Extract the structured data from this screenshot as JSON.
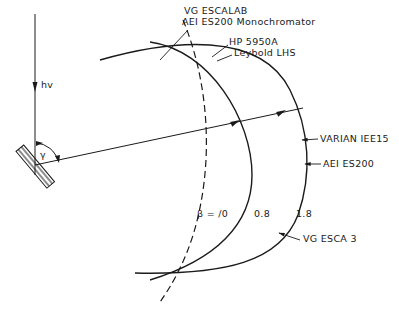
{
  "diagram": {
    "type": "photoelectron spectrometer geometry (Rowland circle family)",
    "colors": {
      "ink": "#1a1a1a",
      "background": "#ffffff"
    },
    "incident_beam": {
      "label": "hv"
    },
    "sample": {
      "angle_label": "γ"
    },
    "curves": [
      {
        "id": "beta-0",
        "style": "dashed",
        "label": "β = /0"
      },
      {
        "id": "beta-0.8",
        "style": "solid",
        "label": "0.8"
      },
      {
        "id": "beta-1.8",
        "style": "solid",
        "label": "1.8"
      }
    ],
    "instrument_labels": [
      {
        "id": "vg-escalab",
        "text": "VG ESCALAB"
      },
      {
        "id": "aei-es200-mono",
        "text": "AEI ES200 Monochromator"
      },
      {
        "id": "hp-5950a",
        "text": "HP 5950A"
      },
      {
        "id": "leybold-lhs",
        "text": "Leybold LHS"
      },
      {
        "id": "varian-iee15",
        "text": "VARIAN IEE15"
      },
      {
        "id": "aei-es200",
        "text": "AEI ES200"
      },
      {
        "id": "vg-esca3",
        "text": "VG ESCA 3"
      }
    ]
  }
}
